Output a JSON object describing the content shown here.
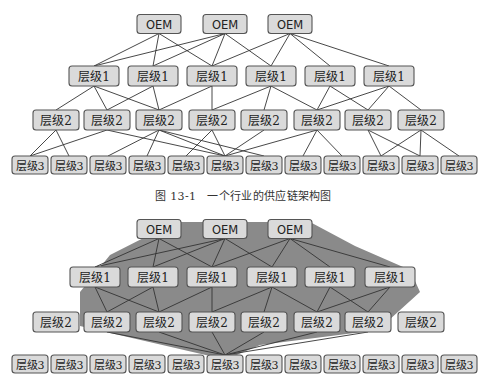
{
  "figure1": {
    "caption": "图 13-1　一个行业的供应链架构图",
    "nodes": {
      "oem": [
        {
          "label": "OEM",
          "x": 159,
          "y": 24
        },
        {
          "label": "OEM",
          "x": 225,
          "y": 24
        },
        {
          "label": "OEM",
          "x": 290,
          "y": 24
        }
      ],
      "tier1": [
        {
          "label": "层级1",
          "x": 94,
          "y": 76
        },
        {
          "label": "层级1",
          "x": 153,
          "y": 76
        },
        {
          "label": "层级1",
          "x": 212,
          "y": 76
        },
        {
          "label": "层级1",
          "x": 271,
          "y": 76
        },
        {
          "label": "层级1",
          "x": 330,
          "y": 76
        },
        {
          "label": "层级1",
          "x": 389,
          "y": 76
        }
      ],
      "tier2": [
        {
          "label": "层级2",
          "x": 56,
          "y": 120
        },
        {
          "label": "层级2",
          "x": 107,
          "y": 120
        },
        {
          "label": "层级2",
          "x": 159,
          "y": 120
        },
        {
          "label": "层级2",
          "x": 212,
          "y": 120
        },
        {
          "label": "层级2",
          "x": 264,
          "y": 120
        },
        {
          "label": "层级2",
          "x": 317,
          "y": 120
        },
        {
          "label": "层级2",
          "x": 368,
          "y": 120
        },
        {
          "label": "层级2",
          "x": 421,
          "y": 120
        }
      ],
      "tier3": [
        {
          "label": "层级3",
          "x": 30,
          "y": 165
        },
        {
          "label": "层级3",
          "x": 69,
          "y": 165
        },
        {
          "label": "层级3",
          "x": 108,
          "y": 165
        },
        {
          "label": "层级3",
          "x": 147,
          "y": 165
        },
        {
          "label": "层级3",
          "x": 186,
          "y": 165
        },
        {
          "label": "层级3",
          "x": 225,
          "y": 165
        },
        {
          "label": "层级3",
          "x": 264,
          "y": 165
        },
        {
          "label": "层级3",
          "x": 303,
          "y": 165
        },
        {
          "label": "层级3",
          "x": 342,
          "y": 165
        },
        {
          "label": "层级3",
          "x": 381,
          "y": 165
        },
        {
          "label": "层级3",
          "x": 420,
          "y": 165
        },
        {
          "label": "层级3",
          "x": 459,
          "y": 165
        }
      ]
    }
  },
  "figure2": {
    "nodes": {
      "oem": [
        {
          "label": "OEM",
          "x": 159,
          "y": 229
        },
        {
          "label": "OEM",
          "x": 225,
          "y": 229
        },
        {
          "label": "OEM",
          "x": 290,
          "y": 229
        }
      ],
      "tier1": [
        {
          "label": "层级1",
          "x": 95,
          "y": 277
        },
        {
          "label": "层级1",
          "x": 153,
          "y": 277
        },
        {
          "label": "层级1",
          "x": 212,
          "y": 277
        },
        {
          "label": "层级1",
          "x": 272,
          "y": 277
        },
        {
          "label": "层级1",
          "x": 330,
          "y": 277
        },
        {
          "label": "层级1",
          "x": 390,
          "y": 277
        }
      ],
      "tier2": [
        {
          "label": "层级2",
          "x": 56,
          "y": 322
        },
        {
          "label": "层级2",
          "x": 107,
          "y": 322
        },
        {
          "label": "层级2",
          "x": 159,
          "y": 322
        },
        {
          "label": "层级2",
          "x": 212,
          "y": 322
        },
        {
          "label": "层级2",
          "x": 264,
          "y": 322
        },
        {
          "label": "层级2",
          "x": 317,
          "y": 322
        },
        {
          "label": "层级2",
          "x": 368,
          "y": 322
        },
        {
          "label": "层级2",
          "x": 421,
          "y": 322
        }
      ],
      "tier3": [
        {
          "label": "层级3",
          "x": 30,
          "y": 364
        },
        {
          "label": "层级3",
          "x": 69,
          "y": 364
        },
        {
          "label": "层级3",
          "x": 108,
          "y": 364
        },
        {
          "label": "层级3",
          "x": 147,
          "y": 364
        },
        {
          "label": "层级3",
          "x": 186,
          "y": 364
        },
        {
          "label": "层级3",
          "x": 225,
          "y": 364
        },
        {
          "label": "层级3",
          "x": 264,
          "y": 364
        },
        {
          "label": "层级3",
          "x": 303,
          "y": 364
        },
        {
          "label": "层级3",
          "x": 342,
          "y": 364
        },
        {
          "label": "层级3",
          "x": 381,
          "y": 364
        },
        {
          "label": "层级3",
          "x": 420,
          "y": 364
        },
        {
          "label": "层级3",
          "x": 459,
          "y": 364
        }
      ]
    },
    "highlight_color": "#8a8a8a"
  },
  "colors": {
    "box_fill": "#dadada",
    "box_stroke": "#555555",
    "edge": "#333333"
  }
}
